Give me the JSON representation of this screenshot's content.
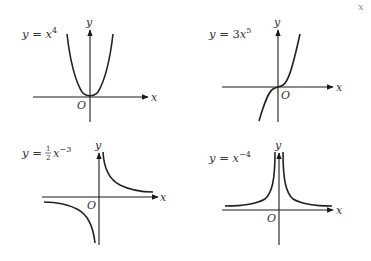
{
  "corner_fragment": "x",
  "graphs": [
    {
      "id": "g1",
      "equation": {
        "prefix": "y = ",
        "coef": "",
        "base": "x",
        "exponent": "4"
      },
      "x_axis_label": "x",
      "y_axis_label": "y",
      "origin_label": "O",
      "shape": "even power, U-shaped through origin"
    },
    {
      "id": "g2",
      "equation": {
        "prefix": "y = ",
        "coef": "3",
        "base": "x",
        "exponent": "5"
      },
      "x_axis_label": "x",
      "y_axis_label": "y",
      "origin_label": "O",
      "shape": "odd power, increasing through origin"
    },
    {
      "id": "g3",
      "equation": {
        "prefix": "y = ",
        "frac_num": "1",
        "frac_den": "2",
        "base": "x",
        "exponent": "−3"
      },
      "x_axis_label": "x",
      "y_axis_label": "y",
      "origin_label": "O",
      "shape": "odd negative power, hyperbola in quadrants I and III"
    },
    {
      "id": "g4",
      "equation": {
        "prefix": "y = ",
        "coef": "",
        "base": "x",
        "exponent": "−4"
      },
      "x_axis_label": "x",
      "y_axis_label": "y",
      "origin_label": "O",
      "shape": "even negative power, both branches above x-axis"
    }
  ],
  "colors": {
    "ink": "#222222",
    "text": "#333333",
    "background": "#ffffff"
  }
}
